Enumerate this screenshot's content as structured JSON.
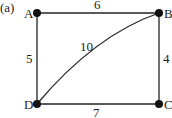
{
  "figure": {
    "label": "(a)",
    "nodes": [
      {
        "id": "A",
        "label": "A",
        "x": 37,
        "y": 13
      },
      {
        "id": "B",
        "label": "B",
        "x": 159,
        "y": 13
      },
      {
        "id": "C",
        "label": "C",
        "x": 159,
        "y": 104
      },
      {
        "id": "D",
        "label": "D",
        "x": 37,
        "y": 104
      }
    ],
    "edges": [
      {
        "from": "A",
        "to": "B",
        "weight": "6"
      },
      {
        "from": "B",
        "to": "C",
        "weight": "4"
      },
      {
        "from": "D",
        "to": "C",
        "weight": "7"
      },
      {
        "from": "A",
        "to": "D",
        "weight": "5"
      },
      {
        "from": "D",
        "to": "B",
        "weight": "10",
        "curved": true
      }
    ]
  }
}
